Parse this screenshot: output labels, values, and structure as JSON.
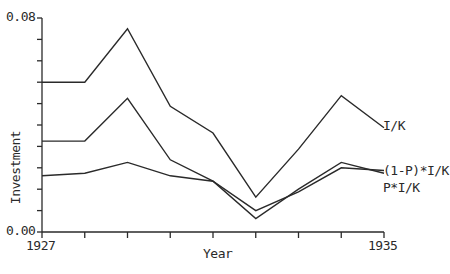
{
  "chart_data": {
    "type": "line",
    "title": "",
    "xlabel": "Year",
    "ylabel": "Investment",
    "x": [
      1927,
      1928,
      1929,
      1930,
      1931,
      1932,
      1933,
      1934,
      1935
    ],
    "xlim": [
      1927,
      1935
    ],
    "ylim": [
      0.0,
      0.08
    ],
    "x_tick_labels": [
      "1927",
      "1935"
    ],
    "y_tick_labels": [
      "0.00",
      "0.08"
    ],
    "y_minor_ticks": 10,
    "grid": false,
    "legend_position": "inline-right",
    "series": [
      {
        "name": "I/K",
        "values": [
          0.056,
          0.056,
          0.076,
          0.047,
          0.037,
          0.013,
          0.031,
          0.051,
          0.039
        ]
      },
      {
        "name": "(1-P)*I/K",
        "values": [
          0.021,
          0.022,
          0.026,
          0.021,
          0.019,
          0.008,
          0.015,
          0.024,
          0.023
        ]
      },
      {
        "name": "P*I/K",
        "values": [
          0.034,
          0.034,
          0.05,
          0.027,
          0.019,
          0.005,
          0.016,
          0.026,
          0.022
        ]
      }
    ]
  },
  "labels": {
    "y_top": "0.08",
    "y_bottom": "0.00",
    "x_left": "1927",
    "x_right": "1935",
    "x_axis": "Year",
    "y_axis": "Investment",
    "series_ik": "I/K",
    "series_1p": "(1-P)*I/K",
    "series_p": "P*I/K"
  }
}
